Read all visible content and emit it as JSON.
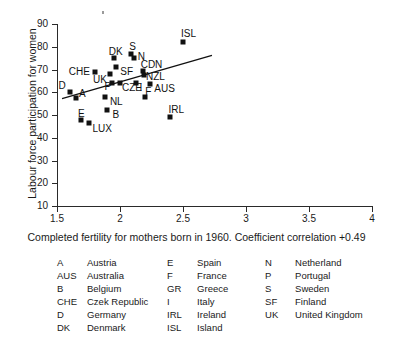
{
  "chart_data": {
    "type": "scatter",
    "title": "",
    "xlabel": "Completed fertility for mothers born in 1960. Coefficient correlation +0.49",
    "ylabel": "Labour force participation for women",
    "xlim": [
      1.5,
      4
    ],
    "ylim": [
      10,
      90
    ],
    "xticks": [
      "1.5",
      "2",
      "2.5",
      "3",
      "3.5",
      "4"
    ],
    "xtick_values": [
      1.5,
      2,
      2.5,
      3,
      3.5,
      4
    ],
    "yticks": [
      "10",
      "20",
      "30",
      "40",
      "50",
      "60",
      "70",
      "80",
      "90"
    ],
    "ytick_values": [
      10,
      20,
      30,
      40,
      50,
      60,
      70,
      80,
      90
    ],
    "grid": false,
    "legend_position": "below-plot",
    "correlation": "+0.49",
    "points": [
      {
        "code": "D",
        "x": 1.6,
        "y": 60.0,
        "label_dx": -11,
        "label_dy": -11
      },
      {
        "code": "A",
        "x": 1.65,
        "y": 57.5,
        "label_dx": 3,
        "label_dy": -9
      },
      {
        "code": "E",
        "x": 1.69,
        "y": 48.0,
        "label_dx": -3,
        "label_dy": -11
      },
      {
        "code": "LUX",
        "x": 1.75,
        "y": 46.5,
        "label_dx": 4,
        "label_dy": 1
      },
      {
        "code": "CHE",
        "x": 1.8,
        "y": 69.0,
        "label_dx": -26,
        "label_dy": -5
      },
      {
        "code": "NL",
        "x": 1.88,
        "y": 58.0,
        "label_dx": 5,
        "label_dy": 0
      },
      {
        "code": "B",
        "x": 1.9,
        "y": 52.0,
        "label_dx": 5,
        "label_dy": 0
      },
      {
        "code": "UK",
        "x": 1.92,
        "y": 68.0,
        "label_dx": -17,
        "label_dy": 1
      },
      {
        "code": "DK",
        "x": 1.95,
        "y": 75.0,
        "label_dx": -5,
        "label_dy": -11
      },
      {
        "code": "P",
        "x": 1.94,
        "y": 64.0,
        "label_dx": -8,
        "label_dy": -1
      },
      {
        "code": "SF",
        "x": 1.97,
        "y": 71.0,
        "label_dx": 4,
        "label_dy": 0
      },
      {
        "code": "CZE",
        "x": 2.0,
        "y": 64.0,
        "label_dx": 2,
        "label_dy": 0
      },
      {
        "code": "S",
        "x": 2.09,
        "y": 77.0,
        "label_dx": -2,
        "label_dy": -12
      },
      {
        "code": "N",
        "x": 2.11,
        "y": 75.0,
        "label_dx": 4,
        "label_dy": -6
      },
      {
        "code": "I",
        "x": 2.13,
        "y": 64.0,
        "label_dx": 3,
        "label_dy": 0
      },
      {
        "code": "CDN",
        "x": 2.18,
        "y": 69.5,
        "label_dx": -2,
        "label_dy": -11
      },
      {
        "code": "NZL",
        "x": 2.19,
        "y": 67.5,
        "label_dx": 2,
        "label_dy": -3
      },
      {
        "code": "F",
        "x": 2.2,
        "y": 58.0,
        "label_dx": 0,
        "label_dy": -10
      },
      {
        "code": "AUS",
        "x": 2.24,
        "y": 63.5,
        "label_dx": 4,
        "label_dy": 0
      },
      {
        "code": "IRL",
        "x": 2.4,
        "y": 49.0,
        "label_dx": -2,
        "label_dy": -12
      },
      {
        "code": "ISL",
        "x": 2.5,
        "y": 82.0,
        "label_dx": -2,
        "label_dy": -13
      }
    ],
    "trend_line": {
      "x_start": 1.54,
      "y_start": 57.2,
      "x_end": 2.73,
      "y_end": 76.2
    }
  },
  "legend": {
    "columns": [
      {
        "entries": [
          {
            "code": "A",
            "name": "Austria"
          },
          {
            "code": "AUS",
            "name": "Australia"
          },
          {
            "code": "B",
            "name": "Belgium"
          },
          {
            "code": "CHE",
            "name": "Czek Republic"
          },
          {
            "code": "D",
            "name": "Germany"
          },
          {
            "code": "DK",
            "name": "Denmark"
          }
        ]
      },
      {
        "entries": [
          {
            "code": "E",
            "name": "Spain"
          },
          {
            "code": "F",
            "name": "France"
          },
          {
            "code": "GR",
            "name": "Greece"
          },
          {
            "code": "I",
            "name": "Italy"
          },
          {
            "code": "IRL",
            "name": "Ireland"
          },
          {
            "code": "ISL",
            "name": "Island"
          }
        ]
      },
      {
        "entries": [
          {
            "code": "N",
            "name": "Netherland"
          },
          {
            "code": "P",
            "name": "Portugal"
          },
          {
            "code": "S",
            "name": "Sweden"
          },
          {
            "code": "SF",
            "name": "Finland"
          },
          {
            "code": "UK",
            "name": "United Kingdom"
          }
        ]
      }
    ]
  },
  "colors": {
    "marker": "#111111",
    "axis": "#2a2a2a",
    "text": "#1a1a1a",
    "background": "#ffffff"
  }
}
